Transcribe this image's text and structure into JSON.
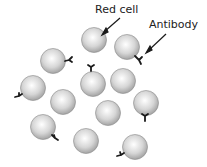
{
  "labels": {
    "red_cell": "Red cell",
    "antibody": "Antibody"
  },
  "colors": {
    "cell_light": "#f4f4f4",
    "cell_dark": "#a8a8a8",
    "antibody": "#1a1a1a"
  }
}
